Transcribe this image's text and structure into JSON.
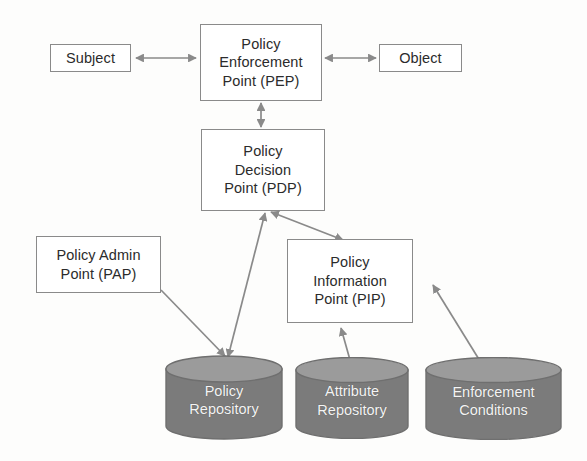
{
  "diagram": {
    "type": "block-diagram",
    "colors": {
      "stroke": "#8a8a8a",
      "box_fill": "#ffffff",
      "box_text": "#2b2b2b",
      "cylinder_body": "#7b7b7b",
      "cylinder_top": "#9b9b9b",
      "cylinder_text": "#f4f4f4",
      "background": "#fdfdfc"
    },
    "nodes": [
      {
        "id": "subject",
        "label": "Subject",
        "shape": "rectangle"
      },
      {
        "id": "pep",
        "label": "Policy\nEnforcement\nPoint (PEP)",
        "shape": "rectangle"
      },
      {
        "id": "object",
        "label": "Object",
        "shape": "rectangle"
      },
      {
        "id": "pdp",
        "label": "Policy\nDecision\nPoint (PDP)",
        "shape": "rectangle"
      },
      {
        "id": "pap",
        "label": "Policy Admin\nPoint (PAP)",
        "shape": "rectangle"
      },
      {
        "id": "pip",
        "label": "Policy\nInformation\nPoint (PIP)",
        "shape": "rectangle"
      },
      {
        "id": "policy_repository",
        "label": "Policy\nRepository",
        "shape": "cylinder"
      },
      {
        "id": "attribute_repository",
        "label": "Attribute\nRepository",
        "shape": "cylinder"
      },
      {
        "id": "enforcement_conditions",
        "label": "Enforcement\nConditions",
        "shape": "cylinder"
      }
    ],
    "edges": [
      {
        "from": "subject",
        "to": "pep",
        "arrow": "both",
        "label": ""
      },
      {
        "from": "object",
        "to": "pep",
        "arrow": "both",
        "label": ""
      },
      {
        "from": "pep",
        "to": "pdp",
        "arrow": "both",
        "label": ""
      },
      {
        "from": "policy_repository",
        "to": "pdp",
        "arrow": "both",
        "label": ""
      },
      {
        "from": "pap",
        "to": "policy_repository",
        "arrow": "single",
        "label": ""
      },
      {
        "from": "pip",
        "to": "pdp",
        "arrow": "both",
        "label": ""
      },
      {
        "from": "attribute_repository",
        "to": "pip",
        "arrow": "single",
        "label": ""
      },
      {
        "from": "enforcement_conditions",
        "to": "pip",
        "arrow": "single",
        "label": ""
      }
    ],
    "ghost_artifacts": [
      {
        "text": "A",
        "x": 300,
        "y": 370
      },
      {
        "text": "BAC",
        "x": 205,
        "y": 372
      }
    ]
  }
}
